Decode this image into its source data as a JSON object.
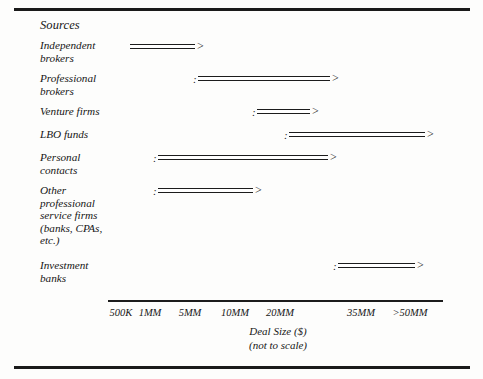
{
  "figure": {
    "column_header": "Sources",
    "axis": {
      "caption_line1": "Deal Size ($)",
      "caption_line2": "(not to scale)",
      "ticks": [
        {
          "label": "500K",
          "x": 121
        },
        {
          "label": "1MM",
          "x": 150
        },
        {
          "label": "5MM",
          "x": 190
        },
        {
          "label": "10MM",
          "x": 235
        },
        {
          "label": "20MM",
          "x": 280
        },
        {
          "label": "35MM",
          "x": 361
        },
        {
          "label": ">50MM",
          "x": 410
        }
      ],
      "line_start_x": 108,
      "line_end_x": 443
    },
    "rows": [
      {
        "label": "Independent\nbrokers",
        "label_top": 39,
        "bar_top": 42,
        "start_marker": "",
        "bar_start_x": 130,
        "bar_end_x": 195,
        "arrow": ">",
        "range_from": "500K",
        "range_to": "1MM"
      },
      {
        "label": "Professional\nbrokers",
        "label_top": 72,
        "bar_top": 74,
        "start_marker": ":",
        "bar_start_x": 198,
        "bar_end_x": 330,
        "arrow": ">",
        "range_from": "5MM",
        "range_to": "20MM"
      },
      {
        "label": "Venture firms",
        "label_top": 105,
        "bar_top": 107,
        "start_marker": ":",
        "bar_start_x": 257,
        "bar_end_x": 310,
        "arrow": ">",
        "range_from": "10MM",
        "range_to": "20MM"
      },
      {
        "label": "LBO funds",
        "label_top": 128,
        "bar_top": 130,
        "start_marker": ":",
        "bar_start_x": 289,
        "bar_end_x": 425,
        "arrow": ">",
        "range_from": "20MM",
        "range_to": ">50MM"
      },
      {
        "label": "Personal\ncontacts",
        "label_top": 151,
        "bar_top": 153,
        "start_marker": ":",
        "bar_start_x": 158,
        "bar_end_x": 328,
        "arrow": ">",
        "range_from": "1MM",
        "range_to": "20MM"
      },
      {
        "label": "Other\nprofessional\nservice firms\n(banks, CPAs,\netc.)",
        "label_top": 184,
        "bar_top": 186,
        "start_marker": ":",
        "bar_start_x": 158,
        "bar_end_x": 253,
        "arrow": ">",
        "range_from": "1MM",
        "range_to": "10MM"
      },
      {
        "label": "Investment\nbanks",
        "label_top": 259,
        "bar_top": 261,
        "start_marker": ":",
        "bar_start_x": 338,
        "bar_end_x": 415,
        "arrow": ">",
        "range_from": "35MM",
        "range_to": ">50MM"
      }
    ]
  },
  "chart_data": {
    "type": "bar",
    "title": "",
    "xlabel": "Deal Size ($) (not to scale)",
    "ylabel": "Sources",
    "grid": false,
    "legend": "none",
    "axis_tick_labels": [
      "500K",
      "1MM",
      "5MM",
      "10MM",
      "20MM",
      "35MM",
      ">50MM"
    ],
    "note": "Horizontal range bars; each bar spans a deal-size range and ends in an open arrowhead.",
    "categories": [
      "Independent brokers",
      "Professional brokers",
      "Venture firms",
      "LBO funds",
      "Personal contacts",
      "Other professional service firms (banks, CPAs, etc.)",
      "Investment banks"
    ],
    "series": [
      {
        "name": "Deal size range",
        "values": [
          {
            "from": "500K",
            "to": "1MM"
          },
          {
            "from": "5MM",
            "to": "20MM"
          },
          {
            "from": "10MM",
            "to": "20MM"
          },
          {
            "from": "20MM",
            "to": ">50MM"
          },
          {
            "from": "1MM",
            "to": "20MM"
          },
          {
            "from": "1MM",
            "to": "10MM"
          },
          {
            "from": "35MM",
            "to": ">50MM"
          }
        ]
      }
    ]
  }
}
